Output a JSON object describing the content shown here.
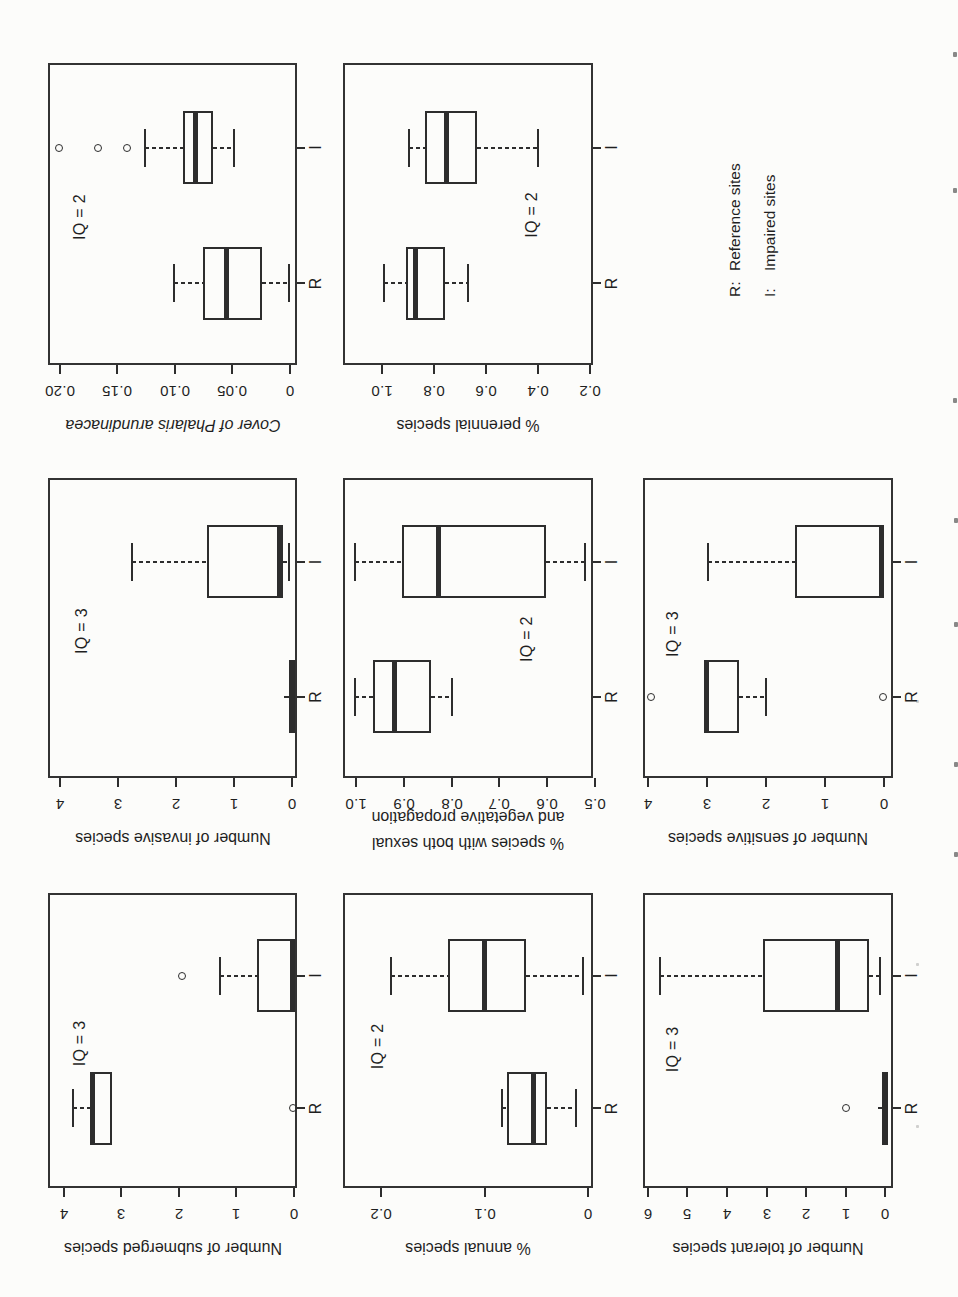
{
  "colors": {
    "ink": "#2d2d2d",
    "frame": "#333333",
    "text": "#1f1f1f",
    "paper": "#fcfcfa"
  },
  "legend": {
    "items": [
      {
        "prefix": "R:",
        "label": "Reference sites"
      },
      {
        "prefix": "I:",
        "label": "Impaired sites"
      }
    ]
  },
  "chart_data": {
    "type": "boxplot-grid",
    "orientation": "entire figure printed rotated 90° counterclockwise on portrait page",
    "categories": [
      "R",
      "I"
    ],
    "legend_cell": {
      "row": 2,
      "col": 2
    },
    "layout": {
      "cols_x": [
        109,
        519,
        932
      ],
      "cols_w": [
        295,
        300,
        302
      ],
      "rows_y": [
        48,
        343,
        643
      ],
      "rows_h": [
        249,
        250,
        250
      ],
      "cat_x": {
        "R": 0.27,
        "I": 0.72
      },
      "box_w": 73,
      "cap_w": 38
    },
    "panels": [
      {
        "id": "number-of-submerged-species",
        "row": 0,
        "col": 0,
        "iq_label": "IQ = 3",
        "iq_x": 0.49,
        "iq_y": 0.13,
        "ylabel_lines": [
          [
            {
              "text": "Number of submerged species",
              "italic": false
            }
          ]
        ],
        "axis": {
          "v_top": 4.27,
          "v_bottom": -0.05,
          "ticks": [
            {
              "v": 4,
              "label": "4"
            },
            {
              "v": 3,
              "label": "3"
            },
            {
              "v": 2,
              "label": "2"
            },
            {
              "v": 1,
              "label": "1"
            },
            {
              "v": 0,
              "label": "0"
            }
          ]
        },
        "groups": [
          {
            "name": "R",
            "degenerate": false,
            "lo": null,
            "q1": 3.16,
            "median": 3.5,
            "q3": 3.5,
            "hi": 3.83,
            "outliers": [
              0.02
            ]
          },
          {
            "name": "I",
            "degenerate": false,
            "lo": null,
            "q1": 0,
            "median": 0.03,
            "q3": 0.65,
            "hi": 1.28,
            "outliers": [
              1.94
            ]
          }
        ]
      },
      {
        "id": "number-of-invasive-species",
        "row": 0,
        "col": 1,
        "iq_label": "IQ = 3",
        "iq_x": 0.49,
        "iq_y": 0.135,
        "ylabel_lines": [
          [
            {
              "text": "Number of invasive species",
              "italic": false
            }
          ]
        ],
        "axis": {
          "v_top": 4.21,
          "v_bottom": -0.09,
          "ticks": [
            {
              "v": 4,
              "label": "4"
            },
            {
              "v": 3,
              "label": "3"
            },
            {
              "v": 2,
              "label": "2"
            },
            {
              "v": 1,
              "label": "1"
            },
            {
              "v": 0,
              "label": "0"
            }
          ]
        },
        "groups": [
          {
            "name": "R",
            "degenerate": true,
            "lo": null,
            "q1": 0,
            "median": 0,
            "q3": 0,
            "hi": 0.13,
            "outliers": []
          },
          {
            "name": "I",
            "degenerate": false,
            "lo": 0.05,
            "q1": 0.15,
            "median": 0.22,
            "q3": 1.47,
            "hi": 2.76,
            "outliers": []
          }
        ]
      },
      {
        "id": "cover-of-phalaris-arundinacea",
        "row": 0,
        "col": 2,
        "iq_label": "IQ = 2",
        "iq_x": 0.49,
        "iq_y": 0.13,
        "ylabel_lines": [
          [
            {
              "text": "Cover of ",
              "italic": true
            },
            {
              "text": "Phalaris arundinacea",
              "italic": true
            }
          ]
        ],
        "axis": {
          "v_top": 0.2104,
          "v_bottom": -0.0061,
          "ticks": [
            {
              "v": 0.2,
              "label": "0.20"
            },
            {
              "v": 0.15,
              "label": "0.15"
            },
            {
              "v": 0.1,
              "label": "0.10"
            },
            {
              "v": 0.05,
              "label": "0.05"
            },
            {
              "v": 0,
              "label": "0"
            }
          ]
        },
        "groups": [
          {
            "name": "R",
            "degenerate": false,
            "lo": 0.001,
            "q1": 0.024,
            "median": 0.055,
            "q3": 0.076,
            "hi": 0.101,
            "outliers": []
          },
          {
            "name": "I",
            "degenerate": false,
            "lo": 0.049,
            "q1": 0.067,
            "median": 0.082,
            "q3": 0.093,
            "hi": 0.126,
            "outliers": [
              0.142,
              0.167,
              0.201
            ]
          }
        ]
      },
      {
        "id": "percent-annual-species",
        "row": 1,
        "col": 0,
        "iq_label": "IQ = 2",
        "iq_x": 0.48,
        "iq_y": 0.14,
        "ylabel_lines": [
          [
            {
              "text": "% annual species",
              "italic": false
            }
          ]
        ],
        "axis": {
          "v_top": 0.2365,
          "v_bottom": -0.0045,
          "ticks": [
            {
              "v": 0.2,
              "label": "0.2"
            },
            {
              "v": 0.1,
              "label": "0.1"
            },
            {
              "v": 0,
              "label": "0"
            }
          ]
        },
        "groups": [
          {
            "name": "R",
            "degenerate": false,
            "lo": 0.012,
            "q1": 0.04,
            "median": 0.053,
            "q3": 0.078,
            "hi": 0.083,
            "outliers": []
          },
          {
            "name": "I",
            "degenerate": false,
            "lo": 0.005,
            "q1": 0.06,
            "median": 0.1,
            "q3": 0.135,
            "hi": 0.19,
            "outliers": []
          }
        ]
      },
      {
        "id": "percent-species-with-both-sexual-and-vegetative-propagation",
        "row": 1,
        "col": 1,
        "iq_label": "IQ = 2",
        "iq_x": 0.463,
        "iq_y": 0.736,
        "ylabel_lines": [
          [
            {
              "text": "% species with both sexual",
              "italic": false
            }
          ],
          [
            {
              "text": "and vegetative propagation",
              "italic": false
            }
          ]
        ],
        "axis": {
          "v_top": 1.028,
          "v_bottom": 0.504,
          "ticks": [
            {
              "v": 1.0,
              "label": "1.0"
            },
            {
              "v": 0.9,
              "label": "0.9"
            },
            {
              "v": 0.8,
              "label": "0.8"
            },
            {
              "v": 0.7,
              "label": "0.7"
            },
            {
              "v": 0.6,
              "label": "0.6"
            },
            {
              "v": 0.5,
              "label": "0.5"
            }
          ]
        },
        "groups": [
          {
            "name": "R",
            "degenerate": false,
            "lo": 0.8,
            "q1": 0.843,
            "median": 0.92,
            "q3": 0.966,
            "hi": 1.002,
            "outliers": []
          },
          {
            "name": "I",
            "degenerate": false,
            "lo": 0.52,
            "q1": 0.603,
            "median": 0.827,
            "q3": 0.904,
            "hi": 1.002,
            "outliers": []
          }
        ]
      },
      {
        "id": "percent-perennial-species",
        "row": 1,
        "col": 2,
        "iq_label": "IQ = 2",
        "iq_x": 0.497,
        "iq_y": 0.756,
        "ylabel_lines": [
          [
            {
              "text": "% perennial species",
              "italic": false
            }
          ]
        ],
        "axis": {
          "v_top": 1.149,
          "v_bottom": 0.188,
          "ticks": [
            {
              "v": 1.0,
              "label": "1.0"
            },
            {
              "v": 0.8,
              "label": "0.8"
            },
            {
              "v": 0.6,
              "label": "0.6"
            },
            {
              "v": 0.4,
              "label": "0.4"
            },
            {
              "v": 0.2,
              "label": "0.2"
            }
          ]
        },
        "groups": [
          {
            "name": "R",
            "degenerate": false,
            "lo": 0.67,
            "q1": 0.756,
            "median": 0.87,
            "q3": 0.906,
            "hi": 0.99,
            "outliers": []
          },
          {
            "name": "I",
            "degenerate": false,
            "lo": 0.4,
            "q1": 0.635,
            "median": 0.75,
            "q3": 0.835,
            "hi": 0.895,
            "outliers": []
          }
        ]
      },
      {
        "id": "number-of-tolerant-species",
        "row": 2,
        "col": 0,
        "iq_label": "IQ = 3",
        "iq_x": 0.47,
        "iq_y": 0.12,
        "ylabel_lines": [
          [
            {
              "text": "Number of tolerant species",
              "italic": false
            }
          ]
        ],
        "axis": {
          "v_top": 6.12,
          "v_bottom": -0.19,
          "ticks": [
            {
              "v": 6,
              "label": "6"
            },
            {
              "v": 5,
              "label": "5"
            },
            {
              "v": 4,
              "label": "4"
            },
            {
              "v": 3,
              "label": "3"
            },
            {
              "v": 2,
              "label": "2"
            },
            {
              "v": 1,
              "label": "1"
            },
            {
              "v": 0,
              "label": "0"
            }
          ]
        },
        "groups": [
          {
            "name": "R",
            "degenerate": true,
            "lo": null,
            "q1": 0,
            "median": 0,
            "q3": 0,
            "hi": 0.2,
            "outliers": [
              1.0
            ]
          },
          {
            "name": "I",
            "degenerate": false,
            "lo": 0.15,
            "q1": 0.42,
            "median": 1.22,
            "q3": 3.1,
            "hi": 5.7,
            "outliers": []
          }
        ]
      },
      {
        "id": "number-of-sensitive-species",
        "row": 2,
        "col": 1,
        "iq_label": "IQ = 3",
        "iq_x": 0.48,
        "iq_y": 0.12,
        "ylabel_lines": [
          [
            {
              "text": "Number of sensitive species",
              "italic": false
            }
          ]
        ],
        "axis": {
          "v_top": 4.08,
          "v_bottom": -0.157,
          "ticks": [
            {
              "v": 4,
              "label": "4"
            },
            {
              "v": 3,
              "label": "3"
            },
            {
              "v": 2,
              "label": "2"
            },
            {
              "v": 1,
              "label": "1"
            },
            {
              "v": 0,
              "label": "0"
            }
          ]
        },
        "groups": [
          {
            "name": "R",
            "degenerate": false,
            "lo": 2.0,
            "q1": 2.45,
            "median": 3.0,
            "q3": 3.0,
            "hi": null,
            "outliers": [
              3.94,
              0.02
            ]
          },
          {
            "name": "I",
            "degenerate": false,
            "lo": null,
            "q1": 0,
            "median": 0.03,
            "q3": 1.5,
            "hi": 2.97,
            "outliers": []
          }
        ]
      }
    ]
  },
  "edge_marks": [
    {
      "x": 953,
      "y": 52,
      "faint": false
    },
    {
      "x": 953,
      "y": 188,
      "faint": false
    },
    {
      "x": 953,
      "y": 398,
      "faint": false
    },
    {
      "x": 954,
      "y": 518,
      "faint": false
    },
    {
      "x": 954,
      "y": 622,
      "faint": false
    },
    {
      "x": 954,
      "y": 762,
      "faint": false
    },
    {
      "x": 954,
      "y": 852,
      "faint": false
    },
    {
      "x": 916,
      "y": 700,
      "faint": true
    },
    {
      "x": 916,
      "y": 963,
      "faint": true
    },
    {
      "x": 916,
      "y": 1125,
      "faint": true
    }
  ]
}
